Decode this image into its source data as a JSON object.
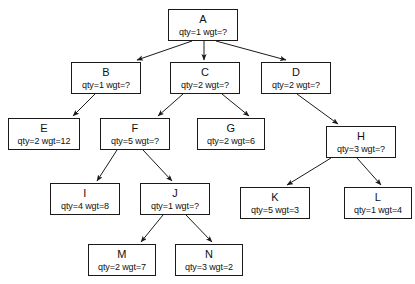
{
  "diagram": {
    "node_width": 70,
    "node_height": 32,
    "box_border_color": "#1a1a1a",
    "background_color": "#ffffff",
    "edge_color": "#1a1a1a",
    "nodes": [
      {
        "id": "A",
        "label": "A",
        "qty": "qty=1",
        "wgt": "wgt=?",
        "attrs": "qty=1 wgt=?",
        "x": 168,
        "y": 9,
        "w": 70,
        "h": 32
      },
      {
        "id": "B",
        "label": "B",
        "qty": "qty=1",
        "wgt": "wgt=?",
        "attrs": "qty=1 wgt=?",
        "x": 71,
        "y": 62,
        "w": 70,
        "h": 32
      },
      {
        "id": "C",
        "label": "C",
        "qty": "qty=2",
        "wgt": "wgt=?",
        "attrs": "qty=2 wgt=?",
        "x": 170,
        "y": 62,
        "w": 70,
        "h": 32
      },
      {
        "id": "D",
        "label": "D",
        "qty": "qty=2",
        "wgt": "wgt=?",
        "attrs": "qty=2 wgt=?",
        "x": 261,
        "y": 62,
        "w": 70,
        "h": 32
      },
      {
        "id": "E",
        "label": "E",
        "qty": "qty=2",
        "wgt": "wgt=12",
        "attrs": "qty=2 wgt=12",
        "x": 8,
        "y": 118,
        "w": 72,
        "h": 32
      },
      {
        "id": "F",
        "label": "F",
        "qty": "qty=5",
        "wgt": "wgt=?",
        "attrs": "qty=5 wgt=?",
        "x": 100,
        "y": 118,
        "w": 70,
        "h": 32
      },
      {
        "id": "G",
        "label": "G",
        "qty": "qty=2",
        "wgt": "wgt=6",
        "attrs": "qty=2 wgt=6",
        "x": 197,
        "y": 118,
        "w": 68,
        "h": 32
      },
      {
        "id": "H",
        "label": "H",
        "qty": "qty=3",
        "wgt": "wgt=?",
        "attrs": "qty=3 wgt=?",
        "x": 326,
        "y": 126,
        "w": 70,
        "h": 32
      },
      {
        "id": "I",
        "label": "I",
        "qty": "qty=4",
        "wgt": "wgt=8",
        "attrs": "qty=4 wgt=8",
        "x": 50,
        "y": 183,
        "w": 70,
        "h": 32
      },
      {
        "id": "J",
        "label": "J",
        "qty": "qty=1",
        "wgt": "wgt=?",
        "attrs": "qty=1 wgt=?",
        "x": 140,
        "y": 183,
        "w": 70,
        "h": 32
      },
      {
        "id": "K",
        "label": "K",
        "qty": "qty=5",
        "wgt": "wgt=3",
        "attrs": "qty=5 wgt=3",
        "x": 240,
        "y": 187,
        "w": 70,
        "h": 32
      },
      {
        "id": "L",
        "label": "L",
        "qty": "qty=1",
        "wgt": "wgt=4",
        "attrs": "qty=1 wgt=4",
        "x": 344,
        "y": 187,
        "w": 68,
        "h": 32
      },
      {
        "id": "M",
        "label": "M",
        "qty": "qty=2",
        "wgt": "wgt=7",
        "attrs": "qty=2 wgt=7",
        "x": 88,
        "y": 244,
        "w": 68,
        "h": 32
      },
      {
        "id": "N",
        "label": "N",
        "qty": "qty=3",
        "wgt": "wgt=2",
        "attrs": "qty=3 wgt=2",
        "x": 175,
        "y": 244,
        "w": 68,
        "h": 32
      }
    ],
    "edges": [
      {
        "from": "A",
        "to": "B",
        "x1": 192,
        "y1": 41,
        "x2": 137,
        "y2": 60
      },
      {
        "from": "A",
        "to": "C",
        "x1": 204,
        "y1": 41,
        "x2": 204,
        "y2": 60
      },
      {
        "from": "A",
        "to": "D",
        "x1": 216,
        "y1": 41,
        "x2": 286,
        "y2": 60
      },
      {
        "from": "B",
        "to": "E",
        "x1": 95,
        "y1": 94,
        "x2": 73,
        "y2": 116
      },
      {
        "from": "C",
        "to": "F",
        "x1": 183,
        "y1": 94,
        "x2": 158,
        "y2": 116
      },
      {
        "from": "C",
        "to": "G",
        "x1": 222,
        "y1": 94,
        "x2": 249,
        "y2": 116
      },
      {
        "from": "D",
        "to": "H",
        "x1": 297,
        "y1": 94,
        "x2": 338,
        "y2": 124
      },
      {
        "from": "F",
        "to": "I",
        "x1": 117,
        "y1": 150,
        "x2": 97,
        "y2": 181
      },
      {
        "from": "F",
        "to": "J",
        "x1": 143,
        "y1": 150,
        "x2": 172,
        "y2": 181
      },
      {
        "from": "H",
        "to": "K",
        "x1": 331,
        "y1": 158,
        "x2": 287,
        "y2": 185
      },
      {
        "from": "H",
        "to": "L",
        "x1": 357,
        "y1": 158,
        "x2": 381,
        "y2": 185
      },
      {
        "from": "J",
        "to": "M",
        "x1": 163,
        "y1": 215,
        "x2": 141,
        "y2": 242
      },
      {
        "from": "J",
        "to": "N",
        "x1": 186,
        "y1": 215,
        "x2": 212,
        "y2": 242
      }
    ]
  }
}
